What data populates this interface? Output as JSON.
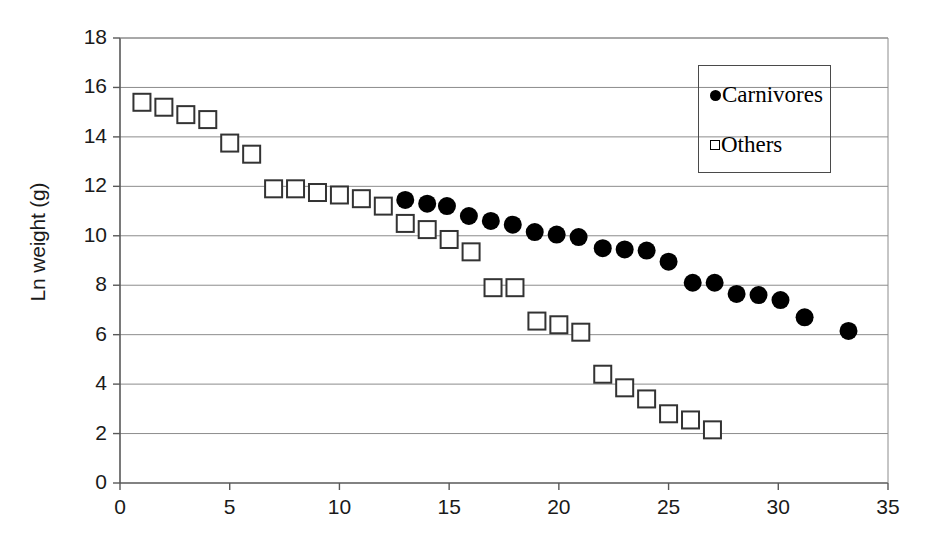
{
  "chart_data": {
    "type": "scatter",
    "title": "",
    "xlabel": "",
    "ylabel": "Ln weight (g)",
    "xlim": [
      0,
      35
    ],
    "ylim": [
      0,
      18
    ],
    "xticks": [
      0,
      5,
      10,
      15,
      20,
      25,
      30,
      35
    ],
    "yticks": [
      0,
      2,
      4,
      6,
      8,
      10,
      12,
      14,
      16,
      18
    ],
    "grid": "horizontal",
    "legend_position": "top-right",
    "legend": [
      "Carnivores",
      "Others"
    ],
    "series": [
      {
        "name": "Carnivores",
        "marker": "filled-circle",
        "color": "#000000",
        "points": [
          [
            13.0,
            11.45
          ],
          [
            14.0,
            11.3
          ],
          [
            14.9,
            11.2
          ],
          [
            15.9,
            10.8
          ],
          [
            16.9,
            10.6
          ],
          [
            17.9,
            10.45
          ],
          [
            18.9,
            10.15
          ],
          [
            19.9,
            10.05
          ],
          [
            20.9,
            9.95
          ],
          [
            22.0,
            9.5
          ],
          [
            23.0,
            9.45
          ],
          [
            24.0,
            9.4
          ],
          [
            25.0,
            8.95
          ],
          [
            26.1,
            8.1
          ],
          [
            27.1,
            8.1
          ],
          [
            28.1,
            7.65
          ],
          [
            29.1,
            7.6
          ],
          [
            30.1,
            7.4
          ],
          [
            31.2,
            6.7
          ],
          [
            33.2,
            6.15
          ]
        ]
      },
      {
        "name": "Others",
        "marker": "open-square",
        "color": "#333333",
        "points": [
          [
            1.0,
            15.4
          ],
          [
            2.0,
            15.2
          ],
          [
            3.0,
            14.9
          ],
          [
            4.0,
            14.7
          ],
          [
            5.0,
            13.75
          ],
          [
            6.0,
            13.3
          ],
          [
            7.0,
            11.9
          ],
          [
            8.0,
            11.9
          ],
          [
            9.0,
            11.75
          ],
          [
            10.0,
            11.65
          ],
          [
            11.0,
            11.5
          ],
          [
            12.0,
            11.2
          ],
          [
            13.0,
            10.5
          ],
          [
            14.0,
            10.25
          ],
          [
            15.0,
            9.85
          ],
          [
            16.0,
            9.35
          ],
          [
            17.0,
            7.9
          ],
          [
            18.0,
            7.9
          ],
          [
            19.0,
            6.55
          ],
          [
            20.0,
            6.4
          ],
          [
            21.0,
            6.1
          ],
          [
            22.0,
            4.4
          ],
          [
            23.0,
            3.85
          ],
          [
            24.0,
            3.4
          ],
          [
            25.0,
            2.8
          ],
          [
            26.0,
            2.55
          ],
          [
            27.0,
            2.15
          ]
        ]
      }
    ]
  },
  "legend": {
    "carnivores_label": "Carnivores",
    "others_label": "Others"
  },
  "axes": {
    "y_title": "Ln weight (g)",
    "y_tick_labels": [
      "18",
      "16",
      "14",
      "12",
      "10",
      "8",
      "6",
      "4",
      "2",
      "0"
    ],
    "x_tick_labels": [
      "0",
      "5",
      "10",
      "15",
      "20",
      "25",
      "30",
      "35"
    ]
  },
  "colors": {
    "axis": "#585858",
    "grid": "#8c8c8c",
    "carnivore_marker": "#000000",
    "other_marker": "#333333",
    "text": "#1a1a1a",
    "background": "#ffffff"
  }
}
